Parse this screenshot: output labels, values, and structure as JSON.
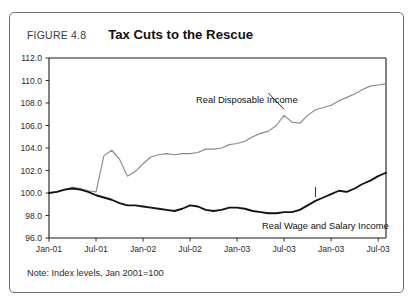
{
  "figure": {
    "number": "FIGURE 4.8",
    "title": "Tax Cuts to the Rescue",
    "footnote": "Note: Index levels, Jan 2001=100"
  },
  "chart_data": {
    "type": "line",
    "title": "Tax Cuts to the Rescue",
    "xlabel": "",
    "ylabel": "",
    "ylim": [
      96.0,
      112.0
    ],
    "ytick_step": 2.0,
    "yticks": [
      "96.0",
      "98.0",
      "100.0",
      "102.0",
      "104.0",
      "106.0",
      "108.0",
      "110.0",
      "112.0"
    ],
    "grid": false,
    "legend": "inline-annotations",
    "xticks": [
      "Jan-01",
      "Jul-01",
      "Jan-02",
      "Jul-02",
      "Jan-03",
      "Jul-03",
      "Jan-03",
      "Jul-03"
    ],
    "x_index": [
      0,
      6,
      12,
      18,
      24,
      30,
      36,
      42
    ],
    "annotations": [
      {
        "text": "Real Disposable Income",
        "series": "Real Disposable Income"
      },
      {
        "text": "Real Wage and Salary Income",
        "series": "Real Wage and Salary Income"
      }
    ],
    "series": [
      {
        "name": "Real Disposable Income",
        "color": "#8a8a8a",
        "values": [
          100.0,
          100.1,
          100.3,
          100.5,
          100.4,
          100.2,
          100.1,
          103.3,
          103.8,
          103.0,
          101.5,
          101.9,
          102.6,
          103.2,
          103.4,
          103.5,
          103.4,
          103.5,
          103.5,
          103.6,
          103.9,
          103.9,
          104.0,
          104.3,
          104.4,
          104.6,
          105.0,
          105.3,
          105.5,
          106.0,
          106.9,
          106.3,
          106.2,
          106.9,
          107.4,
          107.6,
          107.8,
          108.2,
          108.5,
          108.8,
          109.2,
          109.5,
          109.6,
          109.7
        ]
      },
      {
        "name": "Real Wage and Salary Income",
        "color": "#131313",
        "values": [
          100.0,
          100.1,
          100.3,
          100.4,
          100.3,
          100.1,
          99.8,
          99.6,
          99.4,
          99.1,
          98.9,
          98.9,
          98.8,
          98.7,
          98.6,
          98.5,
          98.4,
          98.6,
          98.9,
          98.8,
          98.5,
          98.4,
          98.5,
          98.7,
          98.7,
          98.6,
          98.4,
          98.3,
          98.2,
          98.2,
          98.3,
          98.3,
          98.5,
          98.9,
          99.3,
          99.6,
          99.9,
          100.2,
          100.1,
          100.4,
          100.8,
          101.1,
          101.5,
          101.8
        ]
      }
    ]
  }
}
